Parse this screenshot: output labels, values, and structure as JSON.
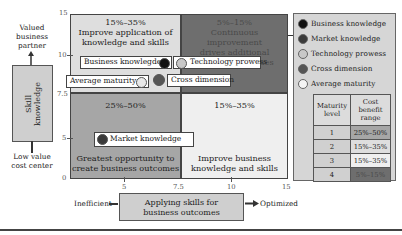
{
  "y_axis": {
    "top_label": "Valued business partner",
    "top_label_lines": [
      "Valued",
      "business",
      "partner"
    ],
    "box_label_lines": [
      "Skill",
      "knowledge"
    ],
    "bottom_label_lines": [
      "Low value",
      "cost center"
    ],
    "ticks": [
      "15",
      "10",
      "7.5",
      "5",
      "0"
    ]
  },
  "x_axis": {
    "left_label": "Inefficient",
    "box_label_lines": [
      "Applying skills for",
      "business outcomes"
    ],
    "right_label": "Optimized",
    "ticks": [
      "5",
      "7.5",
      "10",
      "15"
    ]
  },
  "quadrants": {
    "top_left": {
      "range": "15%–35%",
      "lines": [
        "Improve application of",
        "knowledge and skills"
      ]
    },
    "top_right": {
      "range": "5%–15%",
      "lines": [
        "Continuous improvement",
        "drives additional",
        "business outcomes"
      ]
    },
    "bottom_left": {
      "range": "25%–50%",
      "lines": [
        "Greatest opportunity to",
        "create business outcomes"
      ]
    },
    "bottom_right": {
      "range": "15%–35%",
      "lines": [
        "Improve business",
        "knowledge and skills"
      ]
    }
  },
  "points": {
    "business_knowledge": "Business knowlegde",
    "technology_prowess": "Technology prowess",
    "average_maturity": "Average maturity",
    "cross_dimension": "Cross dimension",
    "market_knowledge": "Market knowledge"
  },
  "legend": {
    "items": [
      {
        "label": "Business knowledge",
        "color": "#111111"
      },
      {
        "label": "Market knowledge",
        "color": "#3a3a3a"
      },
      {
        "label": "Technology prowess",
        "color": "#c8c8c8"
      },
      {
        "label": "Cross dimension",
        "color": "#555555"
      },
      {
        "label": "Average maturity",
        "color": "#f4f4f4"
      }
    ],
    "table": {
      "headers": [
        [
          "Maturity",
          "level"
        ],
        [
          "Cost",
          "benefit",
          "range"
        ]
      ],
      "rows": [
        {
          "level": "1",
          "range": "25%–50%"
        },
        {
          "level": "2",
          "range": "15%–35%"
        },
        {
          "level": "3",
          "range": "15%–35%"
        },
        {
          "level": "4",
          "range": "5%–15%"
        }
      ]
    }
  },
  "colors": {
    "q_top_left": "#dedede",
    "q_top_right": "#6e6e6e",
    "q_bottom_left": "#a6a6a6",
    "q_bottom_right": "#efefef"
  }
}
